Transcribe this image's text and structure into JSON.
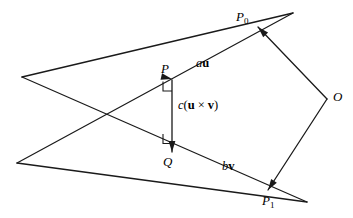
{
  "figure": {
    "background_color": "#ffffff",
    "stroke_color": "#1a1a1a",
    "points": [
      {
        "id": "P0",
        "label": "P",
        "subscript": "0",
        "x": 258,
        "y": 27,
        "label_x": 236,
        "label_y": 10
      },
      {
        "id": "P1",
        "label": "P",
        "subscript": "1",
        "x": 268,
        "y": 190,
        "label_x": 262,
        "label_y": 194
      },
      {
        "id": "P",
        "label": "P",
        "subscript": "",
        "x": 172,
        "y": 80,
        "label_x": 161,
        "label_y": 62
      },
      {
        "id": "Q",
        "label": "Q",
        "subscript": "",
        "x": 172,
        "y": 152,
        "label_x": 163,
        "label_y": 155
      },
      {
        "id": "O",
        "label": "O",
        "subscript": "",
        "x": 327,
        "y": 99,
        "label_x": 333,
        "label_y": 90
      }
    ],
    "vector_labels": [
      {
        "id": "au",
        "scalar": "a",
        "vector": "u",
        "open": "",
        "op": "",
        "vector2": "",
        "close": "",
        "x": 196,
        "y": 57
      },
      {
        "id": "cuxv",
        "scalar": "c",
        "vector": "u",
        "open": "(",
        "op": "×",
        "vector2": "v",
        "close": ")",
        "x": 178,
        "y": 99
      },
      {
        "id": "bv",
        "scalar": "b",
        "vector": "v",
        "open": "",
        "op": "",
        "vector2": "",
        "close": "",
        "x": 222,
        "y": 160
      }
    ],
    "segments": [
      {
        "id": "line-upper",
        "x1": 22,
        "y1": 77,
        "x2": 293,
        "y2": 13,
        "name": "upper-ray"
      },
      {
        "id": "line-lower",
        "x1": 17,
        "y1": 163,
        "x2": 307,
        "y2": 202,
        "name": "lower-ray"
      },
      {
        "id": "line-cross-up",
        "x1": 22,
        "y1": 77,
        "x2": 307,
        "y2": 202,
        "name": "crossing-line-descending"
      },
      {
        "id": "line-cross-down",
        "x1": 17,
        "y1": 163,
        "x2": 293,
        "y2": 13,
        "name": "crossing-line-ascending"
      },
      {
        "id": "pq",
        "x1": 172,
        "y1": 80,
        "x2": 172,
        "y2": 152,
        "name": "pq-segment"
      },
      {
        "id": "o-to-p0",
        "x1": 327,
        "y1": 99,
        "x2": 258,
        "y2": 27,
        "name": "o-to-p0-segment"
      },
      {
        "id": "o-to-p1",
        "x1": 327,
        "y1": 99,
        "x2": 268,
        "y2": 190,
        "name": "o-to-p1-segment"
      }
    ],
    "arrowheads": [
      {
        "id": "arrow-to-P",
        "at_x": 172,
        "at_y": 79,
        "angle": 193,
        "name": "arrow-into-p"
      },
      {
        "id": "arrow-to-Q",
        "at_x": 172,
        "at_y": 152,
        "angle": 90,
        "name": "arrow-into-q"
      },
      {
        "id": "arrow-to-P0",
        "at_x": 258,
        "at_y": 27,
        "angle": 226,
        "name": "arrow-into-p0"
      },
      {
        "id": "arrow-to-P1",
        "at_x": 268,
        "at_y": 190,
        "angle": 123,
        "name": "arrow-into-p1"
      }
    ],
    "right_angle_marks": [
      {
        "id": "ra-at-P",
        "x": 163,
        "y": 83,
        "name": "right-angle-mark-at-p"
      },
      {
        "id": "ra-at-Q",
        "x": 163,
        "y": 136,
        "name": "right-angle-mark-at-q"
      }
    ]
  }
}
